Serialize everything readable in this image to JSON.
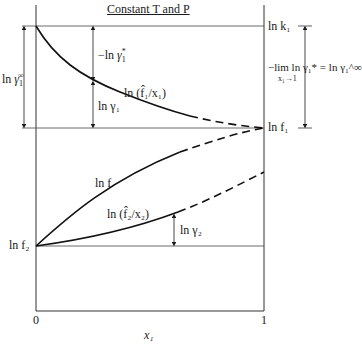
{
  "diagram": {
    "title": "Constant T and P",
    "x_axis": {
      "label": "x₁",
      "tick_0": "0",
      "tick_1": "1"
    },
    "left_labels": {
      "ln_gamma1_inf": "ln γ₁^∞",
      "ln_f2": "ln f₂"
    },
    "right_labels": {
      "ln_k1": "ln k₁",
      "ln_f1": "ln f₁",
      "limit_expr": "−lim ln γ₁* = ln γ₁^∞",
      "limit_sub": "x₁→1"
    },
    "curve_labels": {
      "f1_hat_over_x1": "ln (f̂₁/x₁)",
      "ln_f": "ln f",
      "f2_hat_over_x2": "ln (f̂₂/x₂)"
    },
    "annotations": {
      "neg_ln_gamma1_star": "−ln γ₁*",
      "ln_gamma1": "ln γ₁",
      "ln_gamma2": "ln γ₂"
    },
    "colors": {
      "line": "#1a1a1a",
      "thin": "#444444"
    }
  }
}
